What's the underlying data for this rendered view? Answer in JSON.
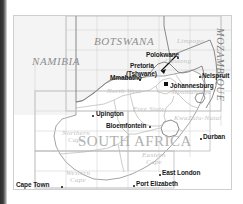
{
  "map": {
    "title": "Map of South Africa and neighbouring countries",
    "countries": [
      {
        "name": "NAMIBIA",
        "x": 18,
        "y": 45
      },
      {
        "name": "BOTSWANA",
        "x": 82,
        "y": 25
      },
      {
        "name": "MOZAMBIQUE",
        "x": 205,
        "y": 16
      }
    ],
    "provinces": [
      {
        "name": "Limpopo",
        "x": 163,
        "y": 24
      },
      {
        "name": "Gauteng",
        "x": 153,
        "y": 42
      },
      {
        "name": "Mpumalanga",
        "x": 160,
        "y": 73
      },
      {
        "name": "North West",
        "x": 98,
        "y": 73
      },
      {
        "name": "Free State",
        "x": 124,
        "y": 90
      },
      {
        "name": "KwaZulu-Natal",
        "x": 166,
        "y": 100
      },
      {
        "name": "Northern Cape",
        "line1": "Northern",
        "line2": "Cape",
        "x": 52,
        "y": 118
      },
      {
        "name": "Eastern Cape",
        "line1": "Eastern",
        "line2": "Cape",
        "x": 131,
        "y": 140
      },
      {
        "name": "Western Cape",
        "line1": "Western",
        "line2": "Cape",
        "x": 55,
        "y": 158
      }
    ],
    "country_name_large": "SOUTH AFRICA",
    "cities": [
      {
        "name": "Polokwane",
        "label_x": 141,
        "label_y": 35,
        "dot_x": 163,
        "dot_y": 41,
        "marker": "dot"
      },
      {
        "name": "Pretoria",
        "label_x": 130,
        "label_y": 49,
        "marker": "none"
      },
      {
        "name": "(Tshwane)",
        "label_x": 128,
        "label_y": 57,
        "marker": "none"
      },
      {
        "name": "Nelspruit",
        "label_x": 189,
        "label_y": 58,
        "dot_x": 185,
        "dot_y": 60,
        "marker": "dot"
      },
      {
        "name": "Mmabatho",
        "label_x": 97,
        "label_y": 58,
        "dot_x": 125,
        "dot_y": 63,
        "marker": "dot"
      },
      {
        "name": "Johannesburg",
        "label_x": 157,
        "label_y": 70,
        "dot_x": 152,
        "dot_y": 68,
        "marker": "square"
      },
      {
        "name": "Upington",
        "label_x": 82,
        "label_y": 97,
        "dot_x": 78,
        "dot_y": 99,
        "marker": "dot"
      },
      {
        "name": "Bloemfontein",
        "label_x": 93,
        "label_y": 110,
        "dot_x": 135,
        "dot_y": 110,
        "marker": "dot"
      },
      {
        "name": "Durban",
        "label_x": 190,
        "label_y": 120,
        "dot_x": 186,
        "dot_y": 122,
        "marker": "dot"
      },
      {
        "name": "East London",
        "label_x": 149,
        "label_y": 156,
        "dot_x": 145,
        "dot_y": 158,
        "marker": "dot"
      },
      {
        "name": "Port Elizabeth",
        "label_x": 123,
        "label_y": 167,
        "dot_x": 119,
        "dot_y": 169,
        "marker": "dot"
      },
      {
        "name": "Cape Town",
        "label_x": 5,
        "label_y": 165,
        "dot_x": 47,
        "dot_y": 170,
        "marker": "dot"
      }
    ],
    "colors": {
      "land": "#ffffff",
      "sea": "#e3e3e3",
      "neighbour_fill": "#f2f2f2",
      "border_line": "#9a9a9a",
      "province_line": "#bfbfbf",
      "grid_line": "#d8d8d8",
      "frame": "#cfcfcf",
      "country_text": "#8e8e8e",
      "province_text": "#c2c2c2",
      "city_text": "#1a1a1a",
      "sa_title_text": "#b0b0b0",
      "edge_bar": "#2e2e2e"
    }
  }
}
